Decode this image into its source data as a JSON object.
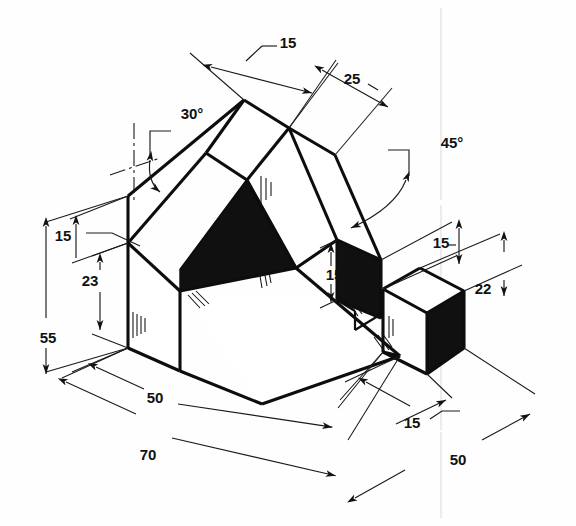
{
  "drawing": {
    "title": "Isometric pictorial drawing of a machined block",
    "units": "mm",
    "background_color": "#fefefe",
    "line_color": "#0d0d0d",
    "fill_dark_color": "#101010"
  },
  "dimensions": [
    {
      "id": "top-15",
      "label": "15",
      "value": 15,
      "kind": "linear",
      "x": 288,
      "y": 43,
      "region": "top"
    },
    {
      "id": "top-25",
      "label": "25",
      "value": 25,
      "kind": "linear",
      "x": 352,
      "y": 79,
      "region": "top"
    },
    {
      "id": "angle-30",
      "label": "30°",
      "value": 30,
      "kind": "angular",
      "x": 192,
      "y": 114,
      "region": "upper-left"
    },
    {
      "id": "angle-45",
      "label": "45°",
      "value": 45,
      "kind": "angular",
      "x": 450,
      "y": 143,
      "region": "upper-right"
    },
    {
      "id": "left-15",
      "label": "15",
      "value": 15,
      "kind": "linear",
      "x": 63,
      "y": 236,
      "region": "left"
    },
    {
      "id": "left-23",
      "label": "23",
      "value": 23,
      "kind": "linear",
      "x": 90,
      "y": 281,
      "region": "left"
    },
    {
      "id": "left-55",
      "label": "55",
      "value": 55,
      "kind": "linear",
      "x": 48,
      "y": 338,
      "region": "left"
    },
    {
      "id": "notch-15",
      "label": "15",
      "value": 15,
      "kind": "linear",
      "x": 334,
      "y": 274,
      "region": "center-right"
    },
    {
      "id": "right-15",
      "label": "15",
      "value": 15,
      "kind": "linear",
      "x": 443,
      "y": 243,
      "region": "right"
    },
    {
      "id": "right-22",
      "label": "22",
      "value": 22,
      "kind": "linear",
      "x": 481,
      "y": 288,
      "region": "right"
    },
    {
      "id": "bottom-50",
      "label": "50",
      "value": 50,
      "kind": "linear",
      "x": 155,
      "y": 398,
      "region": "bottom-left"
    },
    {
      "id": "bottom-70",
      "label": "70",
      "value": 70,
      "kind": "linear",
      "x": 148,
      "y": 455,
      "region": "bottom-left"
    },
    {
      "id": "bottom-15",
      "label": "15",
      "value": 15,
      "kind": "linear",
      "x": 412,
      "y": 423,
      "region": "bottom-right"
    },
    {
      "id": "bottom-r-50",
      "label": "50",
      "value": 50,
      "kind": "linear",
      "x": 458,
      "y": 460,
      "region": "bottom-right"
    }
  ]
}
